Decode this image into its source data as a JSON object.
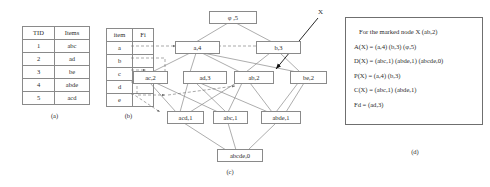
{
  "figure": {
    "captions": {
      "a": "(a)",
      "b": "(b)",
      "c": "(c)",
      "d": "(d)"
    },
    "marker_label": "X"
  },
  "transaction_table": {
    "name": "transaction-database",
    "headers": [
      "TID",
      "Items"
    ],
    "rows": [
      [
        "1",
        "abc"
      ],
      [
        "2",
        "ad"
      ],
      [
        "3",
        "be"
      ],
      [
        "4",
        "abde"
      ],
      [
        "5",
        "acd"
      ]
    ]
  },
  "item_table": {
    "name": "item-pointer-table",
    "headers": [
      "item",
      "Fi"
    ],
    "rows": [
      [
        "a",
        ""
      ],
      [
        "b",
        ""
      ],
      [
        "c",
        ""
      ],
      [
        "d",
        ""
      ],
      [
        "e",
        ""
      ]
    ]
  },
  "lattice": {
    "nodes": [
      {
        "id": "root",
        "label": "φ   ,5",
        "itemset": "φ",
        "support": 5,
        "level": 0
      },
      {
        "id": "a",
        "label": "a,4",
        "itemset": "a",
        "support": 4,
        "level": 1
      },
      {
        "id": "b",
        "label": "b,3",
        "itemset": "b",
        "support": 3,
        "level": 1
      },
      {
        "id": "ac",
        "label": "ac,2",
        "itemset": "ac",
        "support": 2,
        "level": 2
      },
      {
        "id": "ad",
        "label": "ad,3",
        "itemset": "ad",
        "support": 3,
        "level": 2
      },
      {
        "id": "ab",
        "label": "ab,2",
        "itemset": "ab",
        "support": 2,
        "level": 2
      },
      {
        "id": "be",
        "label": "be,2",
        "itemset": "be",
        "support": 2,
        "level": 2
      },
      {
        "id": "acd",
        "label": "acd,1",
        "itemset": "acd",
        "support": 1,
        "level": 3
      },
      {
        "id": "abc",
        "label": "abc,1",
        "itemset": "abc",
        "support": 1,
        "level": 3
      },
      {
        "id": "abde",
        "label": "abde,1",
        "itemset": "abde",
        "support": 1,
        "level": 3
      },
      {
        "id": "abcde",
        "label": "abcde,0",
        "itemset": "abcde",
        "support": 0,
        "level": 4
      }
    ]
  },
  "detail_box": {
    "title": "For the marked node X (ab,2)",
    "lines": [
      "A(X) =   (a,4) (b,3)  (φ,5)",
      "D(X) = (abc,1) (abde,1) (abcde,0)",
      "P(X) = (a,4) (b,3)",
      "C(X) =  (abc,1) (abde,1)",
      "Fd = (ad,3)"
    ]
  }
}
